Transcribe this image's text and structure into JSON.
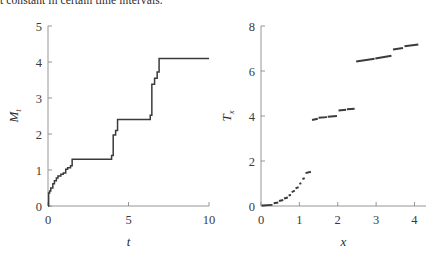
{
  "caption": {
    "text": "t constant in certain time intervals."
  },
  "chart_data": [
    {
      "id": "left",
      "type": "line",
      "title": "",
      "xlabel": "t",
      "ylabel": "M_t",
      "ylabel_base": "M",
      "ylabel_sub": "t",
      "xlim": [
        0,
        10
      ],
      "ylim": [
        0,
        5
      ],
      "xticks": [
        0,
        5,
        10
      ],
      "xticklabels": [
        "0",
        "5",
        "10"
      ],
      "yticks": [
        0,
        1,
        2,
        3,
        4,
        5
      ],
      "yticklabels": [
        "0",
        "1",
        "2",
        "3",
        "4",
        "5"
      ],
      "grid": false,
      "legend": null,
      "series": [
        {
          "name": "running maximum",
          "kind": "step",
          "color": "#3b3b3b",
          "points": [
            [
              0.0,
              0.0
            ],
            [
              0.04,
              0.0
            ],
            [
              0.04,
              0.36
            ],
            [
              0.1,
              0.36
            ],
            [
              0.1,
              0.42
            ],
            [
              0.17,
              0.42
            ],
            [
              0.17,
              0.5
            ],
            [
              0.3,
              0.5
            ],
            [
              0.3,
              0.62
            ],
            [
              0.4,
              0.62
            ],
            [
              0.4,
              0.7
            ],
            [
              0.52,
              0.7
            ],
            [
              0.52,
              0.78
            ],
            [
              0.62,
              0.78
            ],
            [
              0.62,
              0.83
            ],
            [
              0.8,
              0.83
            ],
            [
              0.8,
              0.88
            ],
            [
              0.95,
              0.88
            ],
            [
              0.95,
              0.92
            ],
            [
              1.1,
              0.92
            ],
            [
              1.1,
              1.02
            ],
            [
              1.22,
              1.02
            ],
            [
              1.22,
              1.06
            ],
            [
              1.4,
              1.06
            ],
            [
              1.4,
              1.12
            ],
            [
              1.5,
              1.12
            ],
            [
              1.5,
              1.3
            ],
            [
              3.95,
              1.3
            ],
            [
              3.95,
              1.4
            ],
            [
              4.05,
              1.4
            ],
            [
              4.05,
              1.97
            ],
            [
              4.2,
              1.97
            ],
            [
              4.2,
              2.1
            ],
            [
              4.32,
              2.1
            ],
            [
              4.32,
              2.4
            ],
            [
              6.35,
              2.4
            ],
            [
              6.35,
              2.52
            ],
            [
              6.45,
              2.52
            ],
            [
              6.45,
              3.38
            ],
            [
              6.62,
              3.38
            ],
            [
              6.62,
              3.55
            ],
            [
              6.78,
              3.55
            ],
            [
              6.78,
              3.72
            ],
            [
              6.9,
              3.72
            ],
            [
              6.9,
              4.1
            ],
            [
              10.0,
              4.1
            ]
          ]
        }
      ]
    },
    {
      "id": "right",
      "type": "line",
      "title": "",
      "xlabel": "x",
      "ylabel": "T_x",
      "ylabel_base": "T",
      "ylabel_sub": "x",
      "xlim": [
        0,
        4.3
      ],
      "ylim": [
        0,
        8
      ],
      "xticks": [
        0,
        1,
        2,
        3,
        4
      ],
      "xticklabels": [
        "0",
        "1",
        "2",
        "3",
        "4"
      ],
      "yticks": [
        0,
        2,
        4,
        6,
        8
      ],
      "yticklabels": [
        "0",
        "2",
        "4",
        "6",
        "8"
      ],
      "grid": false,
      "legend": null,
      "series": [
        {
          "name": "first hitting time",
          "kind": "segments",
          "color": "#3b3b3b",
          "segments": [
            [
              [
                0.02,
                0.02
              ],
              [
                0.3,
                0.05
              ]
            ],
            [
              [
                0.33,
                0.12
              ],
              [
                0.45,
                0.16
              ]
            ],
            [
              [
                0.47,
                0.22
              ],
              [
                0.58,
                0.27
              ]
            ],
            [
              [
                0.6,
                0.33
              ],
              [
                0.7,
                0.38
              ]
            ],
            [
              [
                0.72,
                0.46
              ],
              [
                0.78,
                0.5
              ]
            ],
            [
              [
                0.8,
                0.62
              ],
              [
                0.88,
                0.68
              ]
            ],
            [
              [
                0.9,
                0.78
              ],
              [
                0.98,
                0.84
              ]
            ],
            [
              [
                1.0,
                0.98
              ],
              [
                1.05,
                1.02
              ]
            ],
            [
              [
                1.08,
                1.2
              ],
              [
                1.14,
                1.24
              ]
            ],
            [
              [
                1.16,
                1.46
              ],
              [
                1.3,
                1.52
              ]
            ],
            [
              [
                1.33,
                3.82
              ],
              [
                1.48,
                3.88
              ]
            ],
            [
              [
                1.5,
                3.92
              ],
              [
                1.72,
                3.95
              ]
            ],
            [
              [
                1.74,
                3.97
              ],
              [
                1.98,
                4.0
              ]
            ],
            [
              [
                2.02,
                4.24
              ],
              [
                2.22,
                4.28
              ]
            ],
            [
              [
                2.24,
                4.3
              ],
              [
                2.44,
                4.32
              ]
            ],
            [
              [
                2.48,
                6.42
              ],
              [
                2.96,
                6.54
              ]
            ],
            [
              [
                2.98,
                6.56
              ],
              [
                3.4,
                6.68
              ]
            ],
            [
              [
                3.44,
                6.96
              ],
              [
                3.7,
                7.02
              ]
            ],
            [
              [
                3.74,
                7.1
              ],
              [
                4.1,
                7.18
              ]
            ]
          ]
        }
      ]
    }
  ]
}
